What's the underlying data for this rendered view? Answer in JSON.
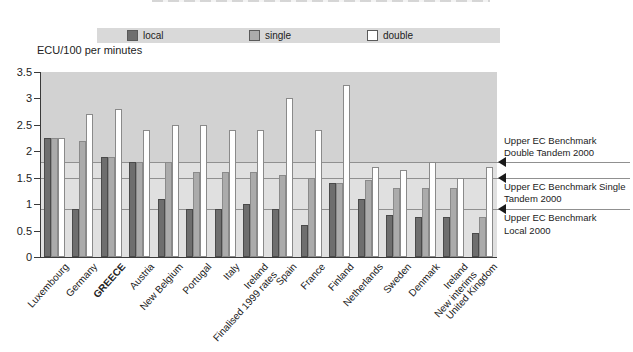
{
  "chart_data": {
    "type": "bar",
    "title": "",
    "ylabel": "ECU/100 per minutes",
    "ylim": [
      0,
      3.5
    ],
    "ytick_values": [
      0,
      0.5,
      1,
      1.5,
      2,
      2.5,
      3,
      3.5
    ],
    "ytick_labels": [
      "0",
      "0.5",
      "1",
      "1.5",
      "2",
      "2.5",
      "3",
      "3.5"
    ],
    "legend_position": "top",
    "legend": [
      "local",
      "single",
      "double"
    ],
    "categories": [
      "Luxembourg",
      "Germany",
      "GREECE",
      "Austria",
      "New Belgium",
      "Portugal",
      "Italy",
      "Ireland\nFinalised 1999 rates",
      "Spain",
      "France",
      "Finland",
      "Netherlands",
      "Sweden",
      "Denmark",
      "Ireland\nNew interims",
      "United Kingdom"
    ],
    "bold_category": "GREECE",
    "series": [
      {
        "name": "local",
        "values": [
          2.25,
          0.9,
          1.9,
          1.8,
          1.1,
          0.9,
          0.9,
          1.0,
          0.9,
          0.6,
          1.4,
          1.1,
          0.8,
          0.75,
          0.75,
          0.45
        ]
      },
      {
        "name": "single",
        "values": [
          2.25,
          2.2,
          1.9,
          1.8,
          1.8,
          1.6,
          1.6,
          1.6,
          1.55,
          1.5,
          1.4,
          1.45,
          1.3,
          1.3,
          1.3,
          0.75
        ]
      },
      {
        "name": "double",
        "values": [
          2.25,
          2.7,
          2.8,
          2.4,
          2.5,
          2.5,
          2.4,
          2.4,
          3.0,
          2.4,
          3.25,
          1.7,
          1.65,
          1.8,
          1.5,
          1.7
        ]
      }
    ],
    "benchmarks": [
      {
        "value": 1.8,
        "label": "Upper EC Benchmark\nDouble Tandem 2000",
        "label_position": "above"
      },
      {
        "value": 1.5,
        "label": "Upper EC Benchmark Single\nTandem 2000",
        "label_position": "below"
      },
      {
        "value": 0.9,
        "label": "Upper EC Benchmark\nLocal 2000",
        "label_position": "below"
      }
    ],
    "grid": "benchmark-lines-only"
  },
  "colors": {
    "local_bar": "#6e6e6e",
    "single_bar": "#ababab",
    "double_bar": "#ffffff",
    "dark_bar_border": "#4a4a4a",
    "light_bar_border": "#8a8a8a",
    "plot_bg_upper": "#d2d2d2",
    "plot_bg_lower": "#e0e0e0",
    "legend_band": "#d9d9d9",
    "benchmark_line": "#909090",
    "axis": "#3a3a3a",
    "arrow": "#1a1a1a"
  }
}
